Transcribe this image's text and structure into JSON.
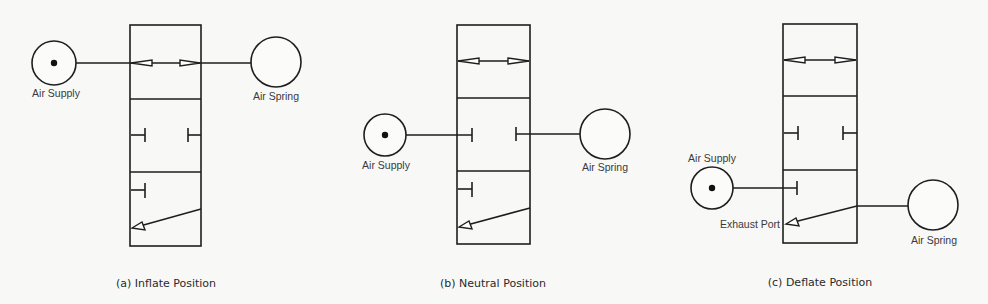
{
  "diagram": {
    "type": "pneumatic-valve-positions",
    "colors": {
      "stroke": "#1e1e1e",
      "text": "#333333",
      "background": "#f8f8f7"
    },
    "panels": [
      {
        "id": "a",
        "caption": "(a) Inflate Position",
        "supply_label": "Air Supply",
        "spring_label": "Air Spring",
        "connected_section": "top",
        "connection": "supply-to-spring"
      },
      {
        "id": "b",
        "caption": "(b) Neutral Position",
        "supply_label": "Air Supply",
        "spring_label": "Air Spring",
        "connected_section": "middle",
        "connection": "blocked"
      },
      {
        "id": "c",
        "caption": "(c) Deflate Position",
        "supply_label": "Air Supply",
        "spring_label": "Air Spring",
        "exhaust_label": "Exhaust Port",
        "connected_section": "bottom",
        "connection": "spring-to-exhaust"
      }
    ]
  }
}
